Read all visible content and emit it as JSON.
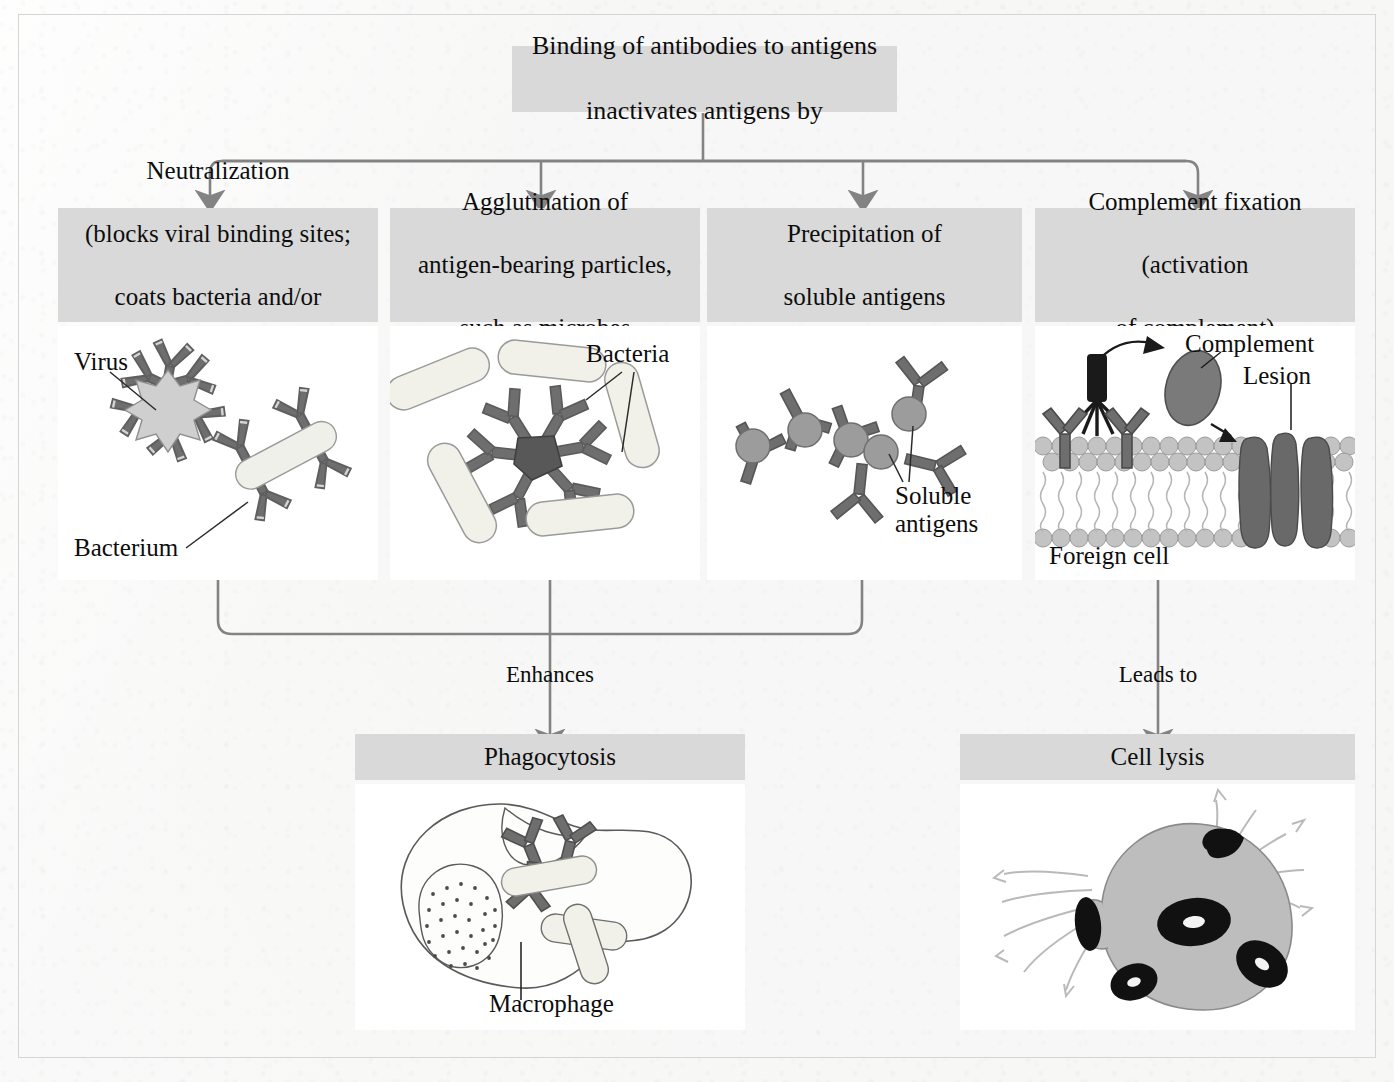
{
  "diagram": {
    "title_box": {
      "line1": "Binding of antibodies to antigens",
      "line2": "inactivates antigens by"
    },
    "columns": [
      {
        "id": "neutralization",
        "header_lines": [
          "Neutralization",
          "(blocks viral binding sites;",
          "coats bacteria and/or",
          "opsonization)"
        ],
        "labels": [
          "Virus",
          "Bacterium"
        ]
      },
      {
        "id": "agglutination",
        "header_lines": [
          "Agglutination of",
          "antigen-bearing particles,",
          "such as microbes"
        ],
        "labels": [
          "Bacteria"
        ]
      },
      {
        "id": "precipitation",
        "header_lines": [
          "Precipitation of",
          "soluble antigens"
        ],
        "labels": [
          "Soluble",
          "antigens"
        ]
      },
      {
        "id": "complement-fixation",
        "header_lines": [
          "Complement fixation",
          "(activation",
          "of complement)"
        ],
        "labels": [
          "Complement",
          "Lesion",
          "Foreign cell"
        ]
      }
    ],
    "connectors": {
      "enhances": "Enhances",
      "leads_to": "Leads to"
    },
    "outcomes": [
      {
        "id": "phagocytosis",
        "label": "Phagocytosis",
        "inner_label": "Macrophage"
      },
      {
        "id": "cell-lysis",
        "label": "Cell lysis",
        "inner_label": ""
      }
    ],
    "colors": {
      "page_background": "#f7f7f6",
      "box_fill": "#d9d9d9",
      "panel_fill": "#ffffff",
      "line": "#7a7a7a",
      "text": "#0d0d0d",
      "antibody": "#6b6b6b",
      "antibody_light": "#cfcfcf",
      "cell_fill": "#c8c8c8",
      "membrane_head": "#bdbdbd"
    }
  }
}
